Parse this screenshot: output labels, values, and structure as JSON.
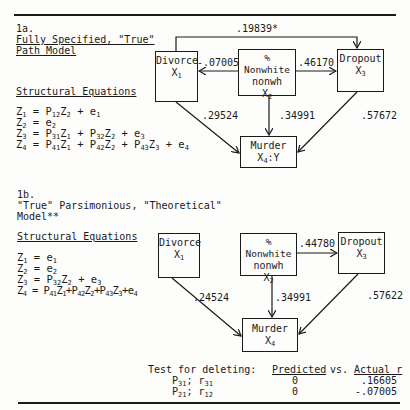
{
  "figure_a": {
    "label": "1a.",
    "title_line1": "Fully Specified, \"True\"",
    "title_line2": "Path Model",
    "equations_heading": "Structural Equations",
    "equations": [
      {
        "lhs": "Z",
        "lhs_sub": "1",
        "rhs": [
          [
            "P",
            "12"
          ],
          [
            "Z",
            "2"
          ],
          [
            " + e",
            "1"
          ]
        ]
      },
      {
        "lhs": "Z",
        "lhs_sub": "2",
        "rhs": [
          [
            "e",
            "2"
          ]
        ]
      },
      {
        "lhs": "Z",
        "lhs_sub": "3",
        "rhs": [
          [
            "P",
            "31"
          ],
          [
            "Z",
            "1"
          ],
          [
            " + P",
            "32"
          ],
          [
            "Z",
            "2"
          ],
          [
            " + e",
            "3"
          ]
        ]
      },
      {
        "lhs": "Z",
        "lhs_sub": "4",
        "rhs": [
          [
            "P",
            "41"
          ],
          [
            "Z",
            "1"
          ],
          [
            " + P",
            "42"
          ],
          [
            "Z",
            "2"
          ],
          [
            " + P",
            "43"
          ],
          [
            "Z",
            "3"
          ],
          [
            " + e",
            "4"
          ]
        ]
      }
    ],
    "nodes": {
      "divorce": {
        "line1": "Divorce",
        "var": "X",
        "var_sub": "1"
      },
      "nonwhite": {
        "line1": "% Nonwhite",
        "line2": "nonwh",
        "var": "X",
        "var_sub": "2"
      },
      "dropout": {
        "line1": "Dropout",
        "var": "X",
        "var_sub": "3"
      },
      "murder": {
        "line1": "Murder",
        "var": "X",
        "var_sub": "4",
        "var_suffix": ":Y"
      }
    },
    "coefficients": {
      "p31": ".19839*",
      "p12": "-.07005",
      "p32": ".46170",
      "p41": ".29524",
      "p42": ".34991",
      "p43": ".57672"
    }
  },
  "figure_b": {
    "label": "1b.",
    "title_line1": "\"True\" Parsimonious, \"Theoretical\"",
    "title_line2": "Model**",
    "equations_heading": "Structural Equations",
    "nodes": {
      "divorce": {
        "line1": "Divorce",
        "var": "X",
        "var_sub": "1"
      },
      "nonwhite": {
        "line1": "% Nonwhite",
        "line2": "nonwh",
        "var": "X",
        "var_sub": "2"
      },
      "dropout": {
        "line1": "Dropout",
        "var": "X",
        "var_sub": "3"
      },
      "murder": {
        "line1": "Murder",
        "var": "X",
        "var_sub": "4"
      }
    },
    "coefficients": {
      "p32": ".44780",
      "p41": ".24524",
      "p42": ".34991",
      "p43": ".57622"
    },
    "test": {
      "label": "Test for deleting:",
      "col_predicted": "Predicted",
      "col_vs": "vs.",
      "col_actual": "Actual r",
      "rows": [
        {
          "p": "P",
          "p_sub": "31",
          "r": "r",
          "r_sub": "31",
          "predicted": "0",
          "actual": ".16605"
        },
        {
          "p": "P",
          "p_sub": "21",
          "r": "r",
          "r_sub": "12",
          "predicted": "0",
          "actual": "-.07005"
        }
      ]
    }
  }
}
